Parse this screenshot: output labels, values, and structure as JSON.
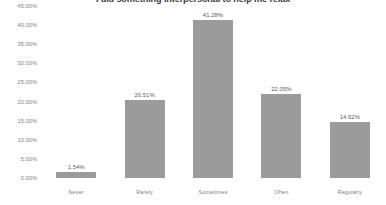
{
  "chart_data": {
    "type": "bar",
    "title": "I did something interpersonal to help me relax",
    "xlabel": "",
    "ylabel": "",
    "categories": [
      "Never",
      "Rarely",
      "Sometimes",
      "Often",
      "Regularly"
    ],
    "values": [
      1.54,
      20.51,
      41.28,
      22.05,
      14.62
    ],
    "value_labels": [
      "1.54%",
      "20.51%",
      "41.28%",
      "22.05%",
      "14.62%"
    ],
    "ylim": [
      0,
      45
    ],
    "ytick_values": [
      0,
      5,
      10,
      15,
      20,
      25,
      30,
      35,
      40,
      45
    ],
    "ytick_labels": [
      "0.00%",
      "5.00%",
      "10.00%",
      "15.00%",
      "20.00%",
      "25.00%",
      "30.00%",
      "35.00%",
      "40.00%",
      "45.00%"
    ],
    "grid": false,
    "legend": false,
    "bar_color": "#9b9b9b",
    "text_color": "#808080",
    "value_label_color": "#595959",
    "title_color": "#3a3a3a",
    "background": "#ffffff"
  }
}
